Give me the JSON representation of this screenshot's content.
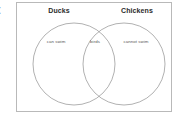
{
  "edge_fragment": {
    "text": "t"
  },
  "diagram": {
    "type": "venn-diagram",
    "sets": [
      {
        "id": "ducks",
        "title": "Ducks",
        "unique_label": "can swim"
      },
      {
        "id": "chickens",
        "title": "Chickens",
        "unique_label": "cannot swim"
      }
    ],
    "intersection": {
      "label": "birds"
    },
    "colors": {
      "frame_border": "#b9b9b9",
      "circle_stroke": "#8f8f8f",
      "background": "#ffffff",
      "title_text": "#2b2b2b",
      "label_text": "#5a5a5a"
    }
  }
}
